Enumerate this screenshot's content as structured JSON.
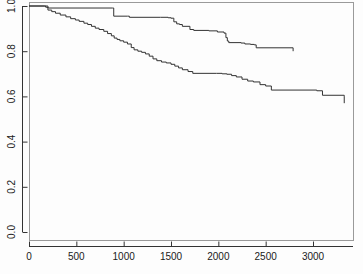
{
  "chart_data": {
    "type": "line",
    "subtype": "kaplan-meier-step",
    "title": "",
    "subtitle": "",
    "xlabel": "",
    "ylabel": "",
    "xlim": [
      0,
      3420
    ],
    "ylim": [
      0.0,
      1.0
    ],
    "xticks": [
      0,
      500,
      1000,
      1500,
      2000,
      2500,
      3000
    ],
    "xtick_labels": [
      "0",
      "500",
      "1000",
      "1500",
      "2000",
      "2500",
      "3000"
    ],
    "yticks": [
      0.0,
      0.2,
      0.4,
      0.6,
      0.8,
      1.0
    ],
    "ytick_labels": [
      "0.0",
      "0.2",
      "0.4",
      "0.6",
      "0.8",
      "1.0"
    ],
    "grid": false,
    "legend": null,
    "legend_position": "none",
    "y_axis_label_rotation": -90,
    "frame": "box",
    "line_color": "#333333",
    "line_width": 1,
    "background_color": "#fdfdfd",
    "series": [
      {
        "name": "upper-curve",
        "color": "#333333",
        "x": [
          0,
          160,
          175,
          190,
          205,
          880,
          895,
          1040,
          1060,
          1390,
          1470,
          1500,
          1530,
          1560,
          1590,
          1620,
          1700,
          1740,
          1900,
          1990,
          2060,
          2080,
          2095,
          2110,
          2240,
          2280,
          2340,
          2380,
          2400,
          2790
        ],
        "y": [
          1.0,
          1.0,
          0.995,
          0.993,
          0.991,
          0.991,
          0.955,
          0.955,
          0.95,
          0.95,
          0.948,
          0.946,
          0.93,
          0.921,
          0.918,
          0.91,
          0.896,
          0.892,
          0.89,
          0.885,
          0.88,
          0.86,
          0.845,
          0.838,
          0.836,
          0.832,
          0.83,
          0.828,
          0.815,
          0.815
        ],
        "end_x": 2790,
        "end_y": 0.8
      },
      {
        "name": "lower-curve",
        "color": "#333333",
        "x": [
          0,
          160,
          200,
          240,
          280,
          330,
          390,
          440,
          490,
          530,
          580,
          620,
          660,
          700,
          740,
          790,
          830,
          870,
          900,
          930,
          960,
          1000,
          1040,
          1080,
          1110,
          1150,
          1190,
          1230,
          1270,
          1310,
          1350,
          1400,
          1450,
          1500,
          1540,
          1580,
          1620,
          1680,
          1730,
          1980,
          2040,
          2090,
          2140,
          2190,
          2250,
          2310,
          2370,
          2440,
          2500,
          2560,
          3040,
          3100,
          3330
        ],
        "y": [
          1.0,
          1.0,
          0.982,
          0.975,
          0.968,
          0.96,
          0.952,
          0.944,
          0.938,
          0.932,
          0.924,
          0.918,
          0.91,
          0.902,
          0.896,
          0.888,
          0.878,
          0.868,
          0.858,
          0.852,
          0.846,
          0.84,
          0.832,
          0.816,
          0.806,
          0.8,
          0.795,
          0.788,
          0.778,
          0.766,
          0.758,
          0.752,
          0.748,
          0.742,
          0.734,
          0.726,
          0.718,
          0.71,
          0.702,
          0.702,
          0.7,
          0.698,
          0.692,
          0.686,
          0.676,
          0.668,
          0.664,
          0.652,
          0.646,
          0.628,
          0.625,
          0.605,
          0.598
        ],
        "end_x": 3330,
        "end_y": 0.57
      }
    ]
  },
  "axes": {
    "x_axis_name": "time-axis",
    "y_axis_name": "survival-probability-axis"
  }
}
